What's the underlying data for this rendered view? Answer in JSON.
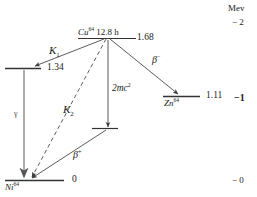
{
  "diagram": {
    "title_axis_unit": "Mev",
    "levels": [
      {
        "id": "cu64",
        "nuclide_symbol": "Cu",
        "mass_number": "64",
        "halflife": "12.8 h",
        "energy": "1.68"
      },
      {
        "id": "ni64x",
        "nuclide_symbol": "",
        "mass_number": "",
        "halflife": "",
        "energy": "1.34"
      },
      {
        "id": "zn64",
        "nuclide_symbol": "Zn",
        "mass_number": "64",
        "halflife": "",
        "energy": "1.11"
      },
      {
        "id": "ni64",
        "nuclide_symbol": "Ni",
        "mass_number": "64",
        "halflife": "",
        "energy": "0"
      }
    ],
    "transitions": [
      {
        "id": "k1",
        "label": "K",
        "sub": "1",
        "sup": ""
      },
      {
        "id": "k2",
        "label": "K",
        "sub": "2",
        "sup": ""
      },
      {
        "id": "gamma",
        "label": "γ",
        "sub": "",
        "sup": ""
      },
      {
        "id": "betaplus",
        "label": "β",
        "sub": "",
        "sup": "+"
      },
      {
        "id": "betaminus",
        "label": "β",
        "sub": "",
        "sup": "−"
      },
      {
        "id": "restmass",
        "label": "2mc",
        "sub": "",
        "sup": "2"
      }
    ],
    "energy_axis": {
      "unit": "Mev",
      "ticks": [
        {
          "label": "− 2",
          "bold": false
        },
        {
          "label": "−1",
          "bold": true
        },
        {
          "label": "− 0",
          "bold": false
        }
      ]
    }
  }
}
